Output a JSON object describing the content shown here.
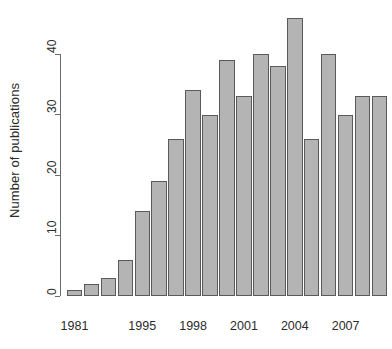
{
  "chart_data": {
    "type": "bar",
    "title": "",
    "subtitle": "",
    "xlabel": "",
    "ylabel": "Number of publications",
    "ylim": [
      0,
      46
    ],
    "yticks": [
      0,
      10,
      20,
      30,
      40
    ],
    "ytick_labels": [
      "0",
      "10",
      "20",
      "30",
      "40"
    ],
    "grid": false,
    "legend": null,
    "bar_color": "#b4b4b4",
    "bar_border_color": "#5a5a5a",
    "axis_color": "#6b6b6b",
    "text_color": "#2b2b2b",
    "categories": [
      "1981",
      "1992",
      "1993",
      "1994",
      "1995",
      "1996",
      "1997",
      "1998",
      "1999",
      "2000",
      "2001",
      "2002",
      "2003",
      "2004",
      "2005",
      "2006",
      "2007",
      "2008",
      "2009"
    ],
    "values": [
      1,
      2,
      3,
      6,
      14,
      19,
      26,
      34,
      30,
      39,
      33,
      40,
      38,
      46,
      26,
      40,
      30,
      33,
      33
    ],
    "visible_xtick_labels": [
      "1981",
      "1995",
      "1998",
      "2001",
      "2004",
      "2007"
    ],
    "visible_xtick_indices": [
      0,
      4,
      7,
      10,
      13,
      16
    ]
  }
}
